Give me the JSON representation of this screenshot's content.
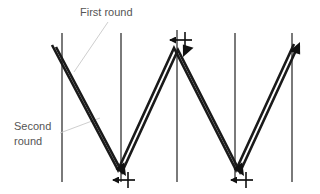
{
  "figure": {
    "background_color": "#ffffff",
    "width": 320,
    "height": 194
  },
  "colors": {
    "vertical_line": "#595959",
    "path_line": "#1a1a1a",
    "arrow_fill": "#111111",
    "leader_line": "#c8c8c8",
    "label_text": "#555555"
  },
  "labels": {
    "first_round": {
      "text": "First round",
      "lines": [
        "First round"
      ],
      "x": 80,
      "y": 16
    },
    "second_round": {
      "text": "Second round",
      "lines": [
        "Second",
        "round"
      ],
      "x": 14,
      "y": 130
    }
  },
  "vertical_lines": [
    {
      "name": "track-1",
      "x": 62,
      "y1": 33,
      "y2": 182
    },
    {
      "name": "track-2",
      "x": 121,
      "y1": 33,
      "y2": 182
    },
    {
      "name": "track-3",
      "x": 177,
      "y1": 30,
      "y2": 182
    },
    {
      "name": "track-4",
      "x": 235,
      "y1": 33,
      "y2": 182
    },
    {
      "name": "track-5",
      "x": 292,
      "y1": 33,
      "y2": 182
    }
  ],
  "path_first_round": {
    "name": "first-round-path",
    "points": "52,45 118,170 174,48 236,170 294,44"
  },
  "path_second_round": {
    "name": "second-round-path",
    "points": "56,47 122,172 178,50 240,172 298,46"
  },
  "arrowheads": [
    {
      "name": "arrowhead-top-middle-down",
      "x": 183,
      "y": 57,
      "angle": 118
    },
    {
      "name": "arrowhead-vertex-bottom-left",
      "x": 126,
      "y": 176,
      "angle": 62
    },
    {
      "name": "arrowhead-vertex-bottom-right",
      "x": 244,
      "y": 176,
      "angle": 62
    },
    {
      "name": "arrowhead-right-end-up",
      "x": 300,
      "y": 42,
      "angle": -62
    }
  ],
  "horizontal_arrows": [
    {
      "name": "tick-arrow-top",
      "x_tail": 192,
      "x_head": 168,
      "y": 40
    },
    {
      "name": "tick-arrow-bottom-left",
      "x_tail": 135,
      "x_head": 111,
      "y": 180
    },
    {
      "name": "tick-arrow-bottom-right",
      "x_tail": 253,
      "x_head": 229,
      "y": 180
    }
  ],
  "tick_marks": [
    {
      "name": "tick-top",
      "x": 185,
      "y1": 32,
      "y2": 48
    },
    {
      "name": "tick-bottom-left",
      "x": 128,
      "y1": 172,
      "y2": 188
    },
    {
      "name": "tick-bottom-right",
      "x": 246,
      "y1": 172,
      "y2": 188
    }
  ],
  "leaders": [
    {
      "name": "leader-first-round",
      "x1": 108,
      "y1": 22,
      "x2": 74,
      "y2": 72
    },
    {
      "name": "leader-second-round",
      "x1": 60,
      "y1": 133,
      "x2": 100,
      "y2": 118
    }
  ]
}
